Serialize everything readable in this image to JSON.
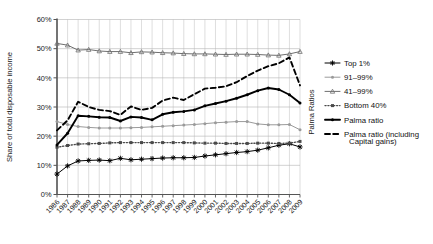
{
  "chart_data": {
    "type": "line",
    "title": "",
    "xlabel": "",
    "ylabel": "Share of total disposable income",
    "ylabel_right": "Palma Ratios",
    "ylim": [
      0,
      60
    ],
    "ytick_labels": [
      "0%",
      "10%",
      "20%",
      "30%",
      "40%",
      "50%",
      "60%"
    ],
    "ytick_values": [
      0,
      10,
      20,
      30,
      40,
      50,
      60
    ],
    "grid": true,
    "legend_position": "right",
    "x": [
      1986,
      1987,
      1988,
      1989,
      1990,
      1991,
      1992,
      1993,
      1994,
      1995,
      1996,
      1997,
      1998,
      1999,
      2000,
      2001,
      2002,
      2003,
      2004,
      2005,
      2006,
      2007,
      2008,
      2009
    ],
    "xtick_labels": [
      "1986",
      "1987",
      "1988",
      "1989",
      "1990",
      "1991",
      "1992",
      "1993",
      "1994",
      "1995",
      "1996",
      "1997",
      "1998",
      "1999",
      "2000",
      "2001",
      "2002",
      "2003",
      "2004",
      "2005",
      "2006",
      "2007",
      "2008",
      "2009"
    ],
    "series": [
      {
        "name": "Top 1%",
        "marker": "star",
        "style": "solid",
        "color": "#000000",
        "values": [
          7.0,
          9.8,
          11.5,
          11.7,
          11.8,
          11.6,
          12.4,
          11.9,
          12.1,
          12.3,
          12.5,
          12.6,
          12.6,
          12.7,
          13.2,
          13.6,
          14.0,
          14.4,
          14.7,
          15.2,
          16.0,
          16.9,
          17.4,
          16.3
        ]
      },
      {
        "name": "91–99%",
        "marker": "dot",
        "style": "solid",
        "color": "#9a9a9a",
        "values": [
          25.0,
          24.0,
          23.3,
          23.0,
          22.8,
          22.8,
          22.8,
          22.9,
          23.0,
          23.2,
          23.4,
          23.6,
          23.8,
          24.0,
          24.3,
          24.6,
          24.8,
          25.0,
          25.0,
          24.2,
          23.9,
          23.9,
          24.0,
          22.2
        ]
      },
      {
        "name": "41–99%",
        "marker": "triangle",
        "style": "solid",
        "color": "#6e6e6e",
        "values": [
          51.8,
          51.2,
          49.5,
          49.7,
          49.2,
          49.0,
          49.0,
          48.6,
          48.9,
          48.8,
          48.6,
          48.5,
          48.3,
          48.2,
          48.2,
          48.1,
          48.0,
          48.1,
          48.1,
          48.0,
          47.8,
          47.7,
          48.2,
          49.0
        ]
      },
      {
        "name": "Bottom 40%",
        "marker": "square",
        "style": "dotted",
        "color": "#4a4a4a",
        "values": [
          16.2,
          16.8,
          17.3,
          17.4,
          17.5,
          17.7,
          17.8,
          17.8,
          17.8,
          17.8,
          17.8,
          17.8,
          17.8,
          17.7,
          17.6,
          17.6,
          17.5,
          17.5,
          17.5,
          17.6,
          17.6,
          17.5,
          17.6,
          18.2
        ]
      },
      {
        "name": "Palma ratio",
        "marker": "dot",
        "style": "solid-thick",
        "color": "#000000",
        "values": [
          17.0,
          21.0,
          27.0,
          26.8,
          26.5,
          26.4,
          25.2,
          26.6,
          26.4,
          25.6,
          27.5,
          28.2,
          28.5,
          29.0,
          30.4,
          31.2,
          32.0,
          33.0,
          34.2,
          35.6,
          36.5,
          36.0,
          34.2,
          31.4
        ]
      },
      {
        "name": "Palma ratio (including Capital gains)",
        "marker": "none",
        "style": "dashed",
        "color": "#000000",
        "values": [
          22.0,
          25.4,
          31.8,
          30.0,
          29.0,
          28.6,
          27.3,
          30.2,
          29.0,
          29.7,
          32.2,
          33.2,
          32.4,
          34.4,
          36.3,
          36.6,
          37.1,
          38.5,
          40.6,
          42.5,
          44.0,
          45.0,
          47.0,
          37.4
        ]
      }
    ]
  },
  "legend": {
    "items": [
      {
        "label": "Top 1%"
      },
      {
        "label": "91–99%"
      },
      {
        "label": "41–99%"
      },
      {
        "label": "Bottom 40%"
      },
      {
        "label": "Palma ratio"
      },
      {
        "label": "Palma ratio (including"
      },
      {
        "label": "Capital gains)"
      }
    ]
  }
}
